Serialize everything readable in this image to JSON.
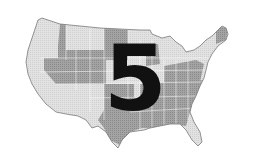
{
  "map": {
    "subject": "United States map",
    "style": "grayscale halftone",
    "colors": {
      "light_region": "#dcdcdc",
      "dark_region": "#9a9a9a",
      "border": "#ffffff",
      "outline": "#7a7a7a"
    }
  },
  "overlay": {
    "numeral": "5",
    "color": "#111111"
  }
}
